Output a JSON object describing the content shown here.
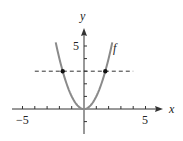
{
  "chart_data": {
    "type": "line",
    "title": "",
    "xlabel": "x",
    "ylabel": "y",
    "curve_label": "f",
    "function": "f(x) = x^2",
    "xlim": [
      -5.5,
      6.5
    ],
    "ylim": [
      -2,
      7
    ],
    "x_ticks": [
      -5,
      -4,
      -3,
      -2,
      -1,
      1,
      2,
      3,
      4,
      5
    ],
    "y_ticks": [
      -1,
      1,
      2,
      3,
      4,
      5
    ],
    "x_tick_labels": [
      "-5",
      "5"
    ],
    "y_tick_labels": [
      "5"
    ],
    "series": [
      {
        "name": "f",
        "style": "solid",
        "color": "#888888",
        "x": [
          -2.3,
          -2,
          -1.5,
          -1,
          -0.5,
          0,
          0.5,
          1,
          1.5,
          2,
          2.3
        ],
        "y": [
          5.29,
          4,
          2.25,
          1,
          0.25,
          0,
          0.25,
          1,
          2.25,
          4,
          5.29
        ]
      },
      {
        "name": "horizontal line y=3",
        "style": "dashed",
        "color": "#333333",
        "x": [
          -4,
          4
        ],
        "y": [
          3,
          3
        ]
      }
    ],
    "points": [
      {
        "x": -1.732,
        "y": 3,
        "label": "intersection"
      },
      {
        "x": 1.732,
        "y": 3,
        "label": "intersection"
      }
    ],
    "grid": false,
    "legend": "none"
  },
  "labels": {
    "x_axis": "x",
    "y_axis": "y",
    "curve": "f",
    "x_neg5": "−5",
    "x_pos5": "5",
    "y_pos5": "5"
  }
}
